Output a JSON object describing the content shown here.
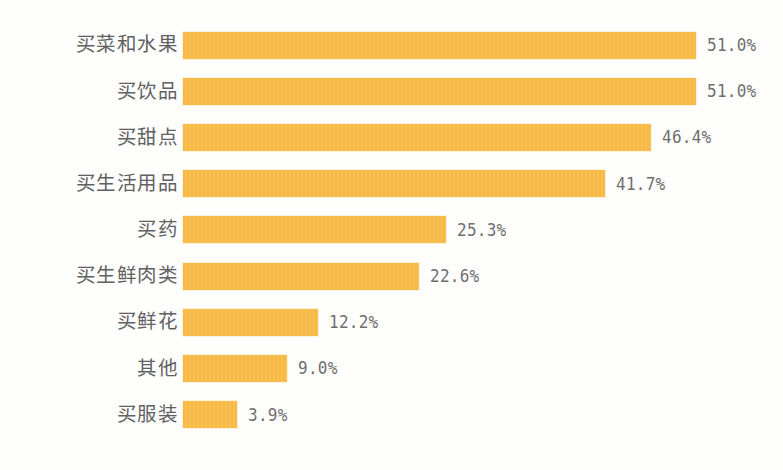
{
  "chart_data": {
    "type": "bar",
    "orientation": "horizontal",
    "title": "",
    "subtitle": "",
    "xlabel": "",
    "ylabel": "",
    "xlim": [
      0,
      51
    ],
    "grid": false,
    "legend": null,
    "value_suffix": "%",
    "categories": [
      "买菜和水果",
      "买饮品",
      "买甜点",
      "买生活用品",
      "买药",
      "买生鲜肉类",
      "买鲜花",
      "其他",
      "买服装"
    ],
    "values": [
      51.0,
      51.0,
      46.4,
      41.7,
      25.3,
      22.6,
      12.2,
      9.0,
      3.9
    ],
    "value_labels": [
      "51.0%",
      "51.0%",
      "46.4%",
      "41.7%",
      "25.3%",
      "22.6%",
      "12.2%",
      "9.0%",
      "3.9%"
    ],
    "bars": [
      {
        "label": "买菜和水果",
        "value": 51.0,
        "value_label": "51.0%",
        "color": "#f7bc48"
      },
      {
        "label": "买饮品",
        "value": 51.0,
        "value_label": "51.0%",
        "color": "#f7bc48"
      },
      {
        "label": "买甜点",
        "value": 46.4,
        "value_label": "46.4%",
        "color": "#f7bc48"
      },
      {
        "label": "买生活用品",
        "value": 41.7,
        "value_label": "41.7%",
        "color": "#f7bc48"
      },
      {
        "label": "买药",
        "value": 25.3,
        "value_label": "25.3%",
        "color": "#f7bc48"
      },
      {
        "label": "买生鲜肉类",
        "value": 22.6,
        "value_label": "22.6%",
        "color": "#f7bc48"
      },
      {
        "label": "买鲜花",
        "value": 12.2,
        "value_label": "12.2%",
        "color": "#f7bc48"
      },
      {
        "label": "其他",
        "value": 9.0,
        "value_label": "9.0%",
        "color": "#f7bc48"
      },
      {
        "label": "买服装",
        "value": 3.9,
        "value_label": "3.9%",
        "color": "#f7bc48"
      }
    ],
    "colors": {
      "bar": "#f7bc48",
      "background": "#fefefd",
      "category_text": "#616161",
      "value_text": "#6e6e6e"
    }
  }
}
